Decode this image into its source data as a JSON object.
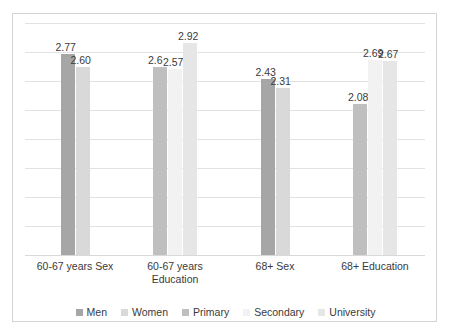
{
  "chart_data": {
    "type": "bar",
    "title": "",
    "subtitle": "",
    "xlabel": "",
    "ylabel": "",
    "ylim": [
      0,
      3.2
    ],
    "grid": true,
    "legend_position": "bottom",
    "categories": [
      "60-67 years Sex",
      "60-67 years Education",
      "68+ Sex",
      "68+ Education"
    ],
    "category_lines": [
      [
        "60-67 years Sex"
      ],
      [
        "60-67 years",
        "Education"
      ],
      [
        "68+ Sex"
      ],
      [
        "68+ Education"
      ]
    ],
    "series": [
      {
        "name": "Men",
        "color": "#a6a6a6",
        "values": [
          2.77,
          null,
          2.43,
          null
        ]
      },
      {
        "name": "Women",
        "color": "#d9d9d9",
        "values": [
          2.6,
          null,
          2.31,
          null
        ]
      },
      {
        "name": "Primary",
        "color": "#bfbfbf",
        "values": [
          null,
          2.6,
          null,
          2.08
        ]
      },
      {
        "name": "Secondary",
        "color": "#f2f2f2",
        "values": [
          null,
          2.57,
          null,
          2.69
        ]
      },
      {
        "name": "University",
        "color": "#e6e6e6",
        "values": [
          null,
          2.92,
          null,
          2.67
        ]
      }
    ],
    "data_labels": [
      {
        "text": "2.77",
        "series": "Men",
        "category": "60-67 years Sex"
      },
      {
        "text": "2.60",
        "series": "Women",
        "category": "60-67 years Sex"
      },
      {
        "text": "2.6",
        "series": "Primary",
        "category": "60-67 years Education"
      },
      {
        "text": "2.57",
        "series": "Secondary",
        "category": "60-67 years Education"
      },
      {
        "text": "2.92",
        "series": "University",
        "category": "60-67 years Education"
      },
      {
        "text": "2.43",
        "series": "Men",
        "category": "68+ Sex"
      },
      {
        "text": "2.31",
        "series": "Women",
        "category": "68+ Sex"
      },
      {
        "text": "2.08",
        "series": "Primary",
        "category": "68+ Education"
      },
      {
        "text": "2.69",
        "series": "Secondary",
        "category": "68+ Education"
      },
      {
        "text": "2.67",
        "series": "University",
        "category": "68+ Education"
      }
    ],
    "gridline_count": 8
  },
  "legend": {
    "items": [
      {
        "label": "Men",
        "color": "#a6a6a6"
      },
      {
        "label": "Women",
        "color": "#d9d9d9"
      },
      {
        "label": "Primary",
        "color": "#bfbfbf"
      },
      {
        "label": "Secondary",
        "color": "#f2f2f2"
      },
      {
        "label": "University",
        "color": "#e6e6e6"
      }
    ]
  },
  "style": {
    "frame_border": "#d4d4d4",
    "gridline": "#e2e2e2",
    "text": "#3a3a3a",
    "background": "#ffffff"
  }
}
